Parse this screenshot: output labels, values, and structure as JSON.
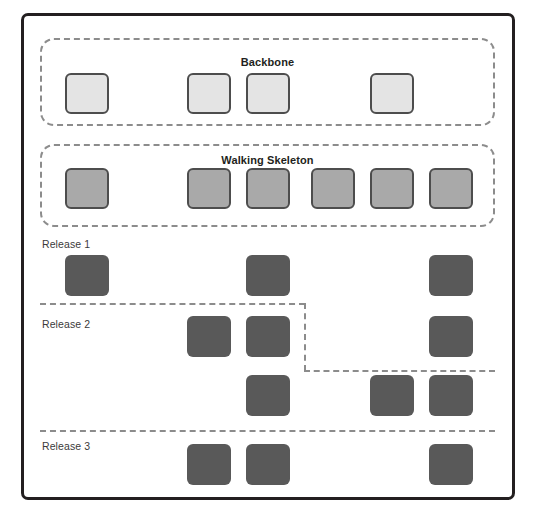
{
  "diagram": {
    "type": "story-map",
    "canvas": {
      "width": 538,
      "height": 529
    },
    "colors": {
      "frame_border": "#231f20",
      "dashed_outline": "#8c8c8c",
      "backbone_card_fill": "#e4e4e4",
      "backbone_card_border": "#4d4d4d",
      "skeleton_card_fill": "#a9a9a9",
      "skeleton_card_border": "#4d4d4d",
      "release_card_fill": "#595959",
      "label_text": "#3b3b3b",
      "group_title_text": "#231f20",
      "background": "#ffffff"
    },
    "columns": [
      63,
      185,
      244,
      309,
      368,
      427
    ],
    "card_size": {
      "width": 44,
      "height": 41
    },
    "groups": [
      {
        "id": "backbone",
        "label": "Backbone",
        "box": {
          "left": 40,
          "top": 38,
          "width": 458,
          "height": 88
        },
        "title_top": 55,
        "card_top": 73,
        "card_style": "backbone",
        "card_columns": [
          0,
          2,
          3,
          5
        ],
        "card_count": 4
      },
      {
        "id": "walking-skeleton",
        "label": "Walking Skeleton",
        "box": {
          "left": 40,
          "top": 144,
          "width": 458,
          "height": 83
        },
        "title_top": 150,
        "card_top": 168,
        "card_style": "skeleton",
        "card_columns": [
          0,
          2,
          3,
          4,
          5
        ],
        "card_count": 6
      }
    ],
    "releases": [
      {
        "id": "release-1",
        "label": "Release 1",
        "label_left": 42,
        "label_top": 238,
        "rows": [
          {
            "top": 255,
            "columns": [
              0,
              2,
              5
            ]
          }
        ]
      },
      {
        "id": "release-2",
        "label": "Release 2",
        "label_left": 42,
        "label_top": 318,
        "rows": [
          {
            "top": 316,
            "columns": [
              1,
              2,
              5
            ]
          },
          {
            "top": 375,
            "columns": [
              2,
              4,
              5
            ]
          }
        ]
      },
      {
        "id": "release-3",
        "label": "Release 3",
        "label_left": 42,
        "label_top": 440,
        "rows": [
          {
            "top": 444,
            "columns": [
              1,
              2,
              5
            ]
          }
        ]
      }
    ],
    "dividers": [
      {
        "id": "release-2-divider-top",
        "orientation": "horizontal",
        "left": 40,
        "top": 303,
        "length": 265
      },
      {
        "id": "release-2-divider-step",
        "orientation": "vertical",
        "left": 303,
        "top": 303,
        "length": 68
      },
      {
        "id": "release-2-divider-bottom",
        "orientation": "horizontal",
        "left": 303,
        "top": 370,
        "length": 195
      },
      {
        "id": "release-3-divider",
        "orientation": "horizontal",
        "left": 40,
        "top": 430,
        "length": 458
      }
    ]
  }
}
